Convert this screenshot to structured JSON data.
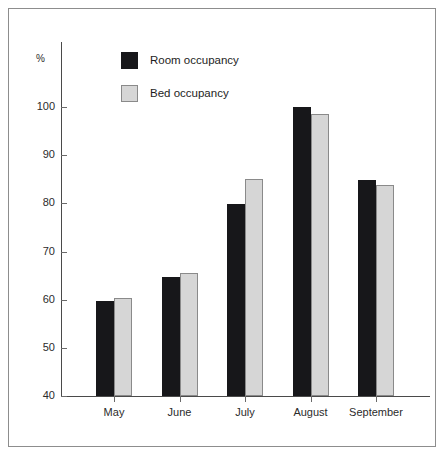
{
  "chart_data": {
    "type": "bar",
    "title": "",
    "subtitle": "",
    "xlabel": "",
    "ylabel": "%",
    "ylim": [
      40,
      100
    ],
    "ytick_values": [
      100,
      90,
      80,
      70,
      60,
      50,
      40
    ],
    "ytick_labels": [
      "100",
      "90",
      "80",
      "70",
      "60",
      "50",
      "40"
    ],
    "grid": false,
    "legend_position": "top-left-inside",
    "categories": [
      "May",
      "June",
      "July",
      "August",
      "September"
    ],
    "series": [
      {
        "name": "Room occupancy",
        "color": "#17171a",
        "values": [
          59.8,
          64.7,
          79.8,
          100.0,
          84.8
        ]
      },
      {
        "name": "Bed occupancy",
        "color": "#d6d6d6",
        "values": [
          60.4,
          65.5,
          85.0,
          98.5,
          83.8
        ]
      }
    ]
  },
  "axis": {
    "y_unit_label": "%"
  },
  "legend": {
    "items": [
      {
        "label": "Room occupancy",
        "swatch": "room"
      },
      {
        "label": "Bed occupancy",
        "swatch": "bed"
      }
    ]
  },
  "colors": {
    "room_occupancy": "#17171a",
    "bed_occupancy": "#d6d6d6",
    "bed_occupancy_edge": "#8a8a8a",
    "axis": "#4a4a4a",
    "frame": "#8d8d8d",
    "text": "#1d1d1d",
    "background": "#ffffff"
  }
}
